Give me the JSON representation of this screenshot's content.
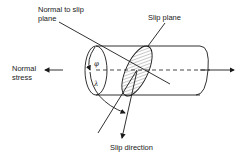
{
  "diagram": {
    "labels": {
      "normal_to_slip_plane_line1": "Normal to slip",
      "normal_to_slip_plane_line2": "plane",
      "slip_plane": "Slip plane",
      "normal_stress_line1": "Normal",
      "normal_stress_line2": "stress",
      "slip_direction": "Slip direction"
    },
    "symbols": {
      "phi": "φ",
      "lambda": "λ"
    },
    "colors": {
      "line": "#1a1a1a",
      "background": "#ffffff"
    }
  }
}
